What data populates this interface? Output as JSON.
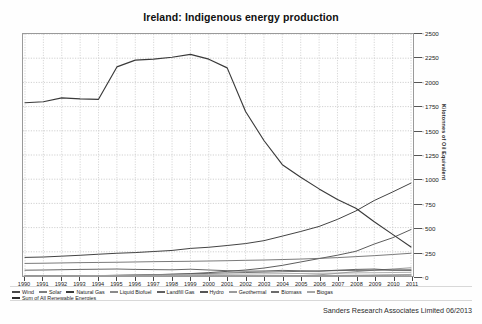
{
  "chart_data": {
    "type": "line",
    "title": "Ireland: Indigenous energy production",
    "xlabel": "",
    "ylabel": "Kilotonnes of Oil Equivalent",
    "ylim": [
      0,
      2500
    ],
    "yticks": [
      0,
      250,
      500,
      750,
      1000,
      1250,
      1500,
      1750,
      2000,
      2250,
      2500
    ],
    "grid": true,
    "legend_position": "bottom",
    "categories": [
      "1990",
      "1991",
      "1992",
      "1993",
      "1994",
      "1995",
      "1996",
      "1997",
      "1998",
      "1999",
      "2000",
      "2001",
      "2002",
      "2003",
      "2004",
      "2005",
      "2006",
      "2007",
      "2008",
      "2009",
      "2010",
      "2011"
    ],
    "series": [
      {
        "name": "Wind",
        "color": "#4a4a4a",
        "values": [
          0,
          0,
          1,
          2,
          4,
          6,
          9,
          13,
          18,
          25,
          35,
          48,
          62,
          82,
          110,
          145,
          180,
          215,
          255,
          330,
          395,
          480
        ]
      },
      {
        "name": "Solar",
        "color": "#7d7d7d",
        "values": [
          0,
          0,
          0,
          0,
          0,
          0,
          0,
          0,
          0,
          0,
          0,
          1,
          1,
          1,
          2,
          2,
          3,
          4,
          5,
          6,
          7,
          8
        ]
      },
      {
        "name": "Natural Gas",
        "color": "#3a3a3a",
        "values": [
          1790,
          1800,
          1840,
          1830,
          1825,
          2160,
          2230,
          2240,
          2260,
          2290,
          2240,
          2150,
          1700,
          1400,
          1150,
          1020,
          900,
          790,
          700,
          560,
          430,
          300
        ]
      },
      {
        "name": "Liquid Biofuel",
        "color": "#8a8a8a",
        "values": [
          0,
          0,
          0,
          0,
          0,
          0,
          0,
          0,
          0,
          0,
          0,
          0,
          0,
          0,
          2,
          5,
          12,
          28,
          45,
          60,
          72,
          85
        ]
      },
      {
        "name": "Landfill Gas",
        "color": "#606060",
        "values": [
          0,
          0,
          1,
          2,
          4,
          7,
          10,
          14,
          18,
          22,
          27,
          32,
          36,
          40,
          44,
          48,
          52,
          56,
          58,
          60,
          62,
          64
        ]
      },
      {
        "name": "Hydro",
        "color": "#555555",
        "values": [
          60,
          62,
          65,
          68,
          70,
          72,
          68,
          66,
          64,
          70,
          62,
          55,
          50,
          52,
          58,
          54,
          50,
          60,
          68,
          72,
          60,
          58
        ]
      },
      {
        "name": "Geothermal",
        "color": "#9a9a9a",
        "values": [
          0,
          0,
          0,
          0,
          0,
          0,
          0,
          0,
          0,
          0,
          0,
          0,
          1,
          1,
          2,
          3,
          4,
          6,
          8,
          10,
          13,
          16
        ]
      },
      {
        "name": "Biomass",
        "color": "#6b6b6b",
        "values": [
          130,
          132,
          135,
          138,
          140,
          142,
          145,
          148,
          150,
          152,
          155,
          158,
          162,
          165,
          170,
          175,
          182,
          190,
          200,
          210,
          222,
          235
        ]
      },
      {
        "name": "Biogas",
        "color": "#a5a5a5",
        "values": [
          0,
          1,
          2,
          3,
          5,
          6,
          8,
          10,
          12,
          14,
          16,
          18,
          20,
          22,
          24,
          26,
          28,
          30,
          32,
          34,
          36,
          38
        ]
      },
      {
        "name": "Sum of All Renewable Energies",
        "color": "#2e2e2e",
        "values": [
          192,
          196,
          205,
          214,
          225,
          235,
          242,
          253,
          264,
          285,
          297,
          315,
          335,
          365,
          412,
          460,
          512,
          585,
          672,
          780,
          868,
          960
        ]
      }
    ]
  },
  "footer": {
    "credit": "Sanders Research Associates Limited 06/2013"
  }
}
